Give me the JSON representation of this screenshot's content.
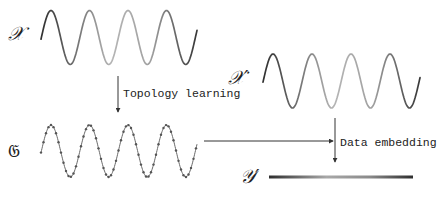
{
  "diagram": {
    "nodes": {
      "x": {
        "label": "𝒳",
        "description": "input data manifold (sine wave)"
      },
      "x_prime": {
        "label": "𝒳′",
        "description": "input data (sine wave)"
      },
      "g": {
        "label": "𝔊",
        "description": "learned graph (dotted sine wave)"
      },
      "y_prime": {
        "label": "𝒴′",
        "description": "1-D embedding (gradient bar)"
      }
    },
    "edges": [
      {
        "from": "x",
        "to": "g",
        "label": "Topology learning"
      },
      {
        "from": "g",
        "to": "embedding",
        "label": ""
      },
      {
        "from": "x_prime",
        "to": "y_prime",
        "label": "Data embedding"
      }
    ],
    "colors": {
      "dark": "#3a3a3a",
      "light": "#b8b8b8",
      "arrow": "#333333"
    }
  }
}
